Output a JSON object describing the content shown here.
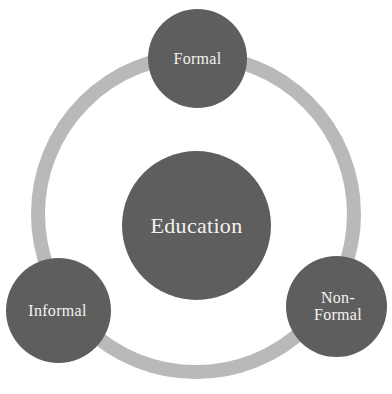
{
  "diagram": {
    "type": "hub-and-spoke-circle",
    "background_color": "#ffffff",
    "ring": {
      "name": "connector-ring",
      "color": "#b9b9b9",
      "center_x": 196,
      "center_y": 214,
      "radius": 158,
      "stroke_width": 14
    },
    "hub": {
      "label": "Education",
      "fill_color": "#5e5e5e",
      "text_color": "#f4f2ee",
      "center_x": 196,
      "center_y": 226,
      "diameter": 149
    },
    "nodes": [
      {
        "id": "formal",
        "label": "Formal",
        "fill_color": "#5e5e5e",
        "text_color": "#f4f2ee",
        "position": "top",
        "center_x": 197,
        "center_y": 58,
        "diameter": 99
      },
      {
        "id": "informal",
        "label": "Informal",
        "fill_color": "#5e5e5e",
        "text_color": "#f4f2ee",
        "position": "bottom-left",
        "center_x": 58,
        "center_y": 310,
        "diameter": 105
      },
      {
        "id": "non-formal",
        "label": "Non-\nFormal",
        "fill_color": "#5e5e5e",
        "text_color": "#f4f2ee",
        "position": "bottom-right",
        "center_x": 336,
        "center_y": 306,
        "diameter": 101
      }
    ]
  }
}
